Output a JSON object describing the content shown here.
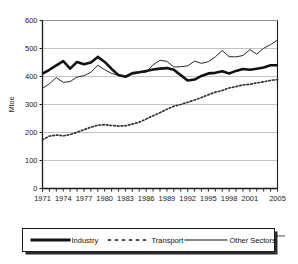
{
  "chart_data": {
    "type": "line",
    "title": "",
    "xlabel": "",
    "ylabel": "Mtoe",
    "ylim": [
      0,
      600
    ],
    "yticks": [
      0,
      100,
      200,
      300,
      400,
      500,
      600
    ],
    "ytick_labels": [
      "0",
      "100",
      "200",
      "300",
      "400",
      "500",
      "600"
    ],
    "xlim": [
      1971,
      2005
    ],
    "xtick_labels": [
      "1971",
      "1974",
      "1977",
      "1980",
      "1983",
      "1986",
      "1989",
      "1992",
      "1995",
      "1998",
      "2001",
      "2005"
    ],
    "grid": "horizontal",
    "legend_position": "bottom",
    "x": [
      1971,
      1972,
      1973,
      1974,
      1975,
      1976,
      1977,
      1978,
      1979,
      1980,
      1981,
      1982,
      1983,
      1984,
      1985,
      1986,
      1987,
      1988,
      1989,
      1990,
      1991,
      1992,
      1993,
      1994,
      1995,
      1996,
      1997,
      1998,
      1999,
      2000,
      2001,
      2002,
      2003,
      2004,
      2005
    ],
    "series": [
      {
        "name": "Industry",
        "style": "thick-solid",
        "color": "#111111",
        "values": [
          410,
          424,
          440,
          455,
          428,
          452,
          444,
          450,
          470,
          452,
          427,
          405,
          399,
          411,
          415,
          420,
          425,
          428,
          430,
          424,
          405,
          386,
          389,
          402,
          411,
          413,
          419,
          411,
          420,
          427,
          424,
          428,
          432,
          440,
          440
        ]
      },
      {
        "name": "Transport",
        "style": "dotted",
        "color": "#333333",
        "values": [
          174,
          187,
          191,
          188,
          193,
          201,
          210,
          219,
          226,
          228,
          225,
          223,
          224,
          230,
          237,
          248,
          260,
          271,
          283,
          294,
          300,
          308,
          316,
          325,
          335,
          344,
          350,
          359,
          364,
          370,
          372,
          377,
          381,
          386,
          389
        ]
      },
      {
        "name": "Other Sectors",
        "style": "thin-solid",
        "color": "#111111",
        "values": [
          358,
          374,
          396,
          379,
          382,
          398,
          403,
          415,
          440,
          424,
          411,
          404,
          401,
          415,
          417,
          415,
          442,
          458,
          454,
          434,
          435,
          438,
          455,
          447,
          453,
          470,
          493,
          471,
          470,
          475,
          496,
          480,
          501,
          514,
          530
        ]
      }
    ]
  },
  "legend": {
    "items": [
      {
        "label": "Industry",
        "style": "thick-solid"
      },
      {
        "label": "Transport",
        "style": "dotted"
      },
      {
        "label": "Other Sectors",
        "suffix": "****",
        "style": "thin-solid"
      }
    ]
  }
}
